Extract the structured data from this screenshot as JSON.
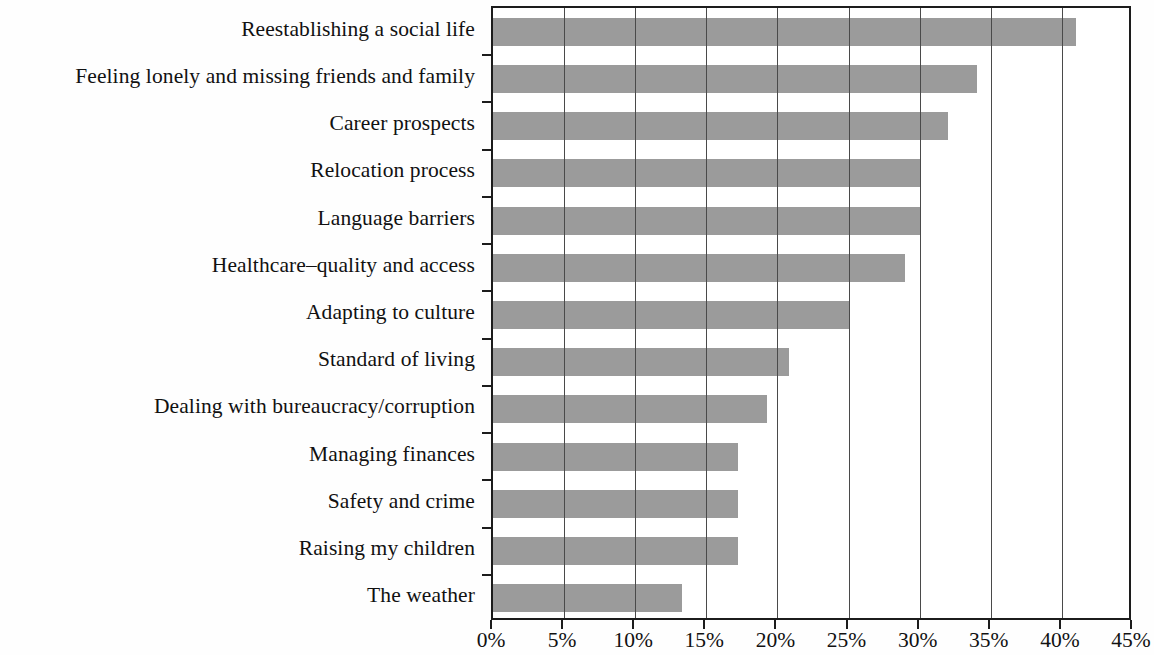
{
  "chart_data": {
    "type": "bar",
    "orientation": "horizontal",
    "title": "",
    "subtitle": "",
    "xlabel": "",
    "ylabel": "",
    "xlim": [
      0,
      45
    ],
    "grid": "vertical",
    "legend": "none",
    "bar_color": "#9b9b9b",
    "axis_color": "#1c1c1c",
    "tick_suffix": "%",
    "tick_step": 5,
    "tick_labels": [
      "0%",
      "5%",
      "10%",
      "15%",
      "20%",
      "25%",
      "30%",
      "35%",
      "40%",
      "45%"
    ],
    "tick_values": [
      0,
      5,
      10,
      15,
      20,
      25,
      30,
      35,
      40,
      45
    ],
    "categories": [
      "Reestablishing a social life",
      "Feeling lonely and missing friends and family",
      "Career prospects",
      "Relocation process",
      "Language barriers",
      "Healthcare–quality and access",
      "Adapting to culture",
      "Standard of living",
      "Dealing with bureaucracy/corruption",
      "Managing finances",
      "Safety and crime",
      "Raising my children",
      "The weather"
    ],
    "values": [
      41.0,
      34.0,
      32.0,
      30.0,
      30.0,
      29.0,
      25.0,
      20.8,
      19.3,
      17.2,
      17.2,
      17.2,
      13.3
    ]
  }
}
